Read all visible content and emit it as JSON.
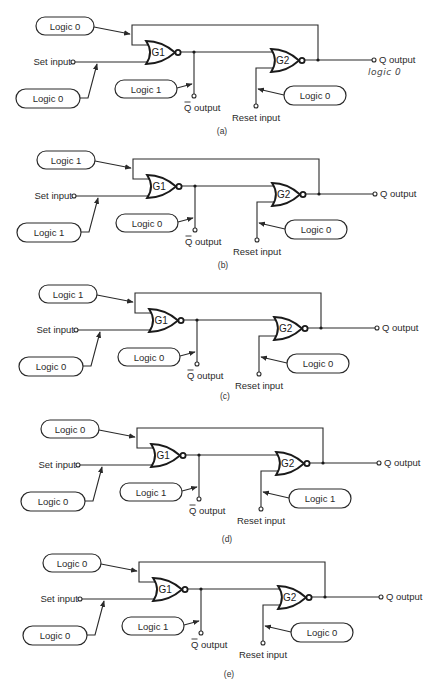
{
  "figure": {
    "common": {
      "set_input_label": "Set input",
      "reset_input_label": "Reset input",
      "q_output_label": "Q output",
      "qbar_output_label": "Q output",
      "gate1_label": "G1",
      "gate2_label": "G2"
    },
    "diagrams": [
      {
        "caption": "(a)",
        "dx": 0,
        "dy": 0,
        "cap_y": 134,
        "feedback_input": "Logic 0",
        "set_input_value": "Logic 0",
        "qbar_value": "Logic 1",
        "reset_input_value": "Logic 0",
        "annotation": "logic 0"
      },
      {
        "caption": "(b)",
        "dx": 1,
        "dy": 134,
        "cap_y": 268,
        "feedback_input": "Logic 1",
        "set_input_value": "Logic 1",
        "qbar_value": "Logic 0",
        "reset_input_value": "Logic 0",
        "annotation": ""
      },
      {
        "caption": "(c)",
        "dx": 3,
        "dy": 268,
        "cap_y": 399,
        "feedback_input": "Logic 1",
        "set_input_value": "Logic 0",
        "qbar_value": "Logic 0",
        "reset_input_value": "Logic 0",
        "annotation": ""
      },
      {
        "caption": "(d)",
        "dx": 5,
        "dy": 403,
        "cap_y": 542,
        "feedback_input": "Logic 0",
        "set_input_value": "Logic 0",
        "qbar_value": "Logic 1",
        "reset_input_value": "Logic 1",
        "annotation": ""
      },
      {
        "caption": "(e)",
        "dx": 7,
        "dy": 537,
        "cap_y": 677,
        "feedback_input": "Logic 0",
        "set_input_value": "Logic 0",
        "qbar_value": "Logic 1",
        "reset_input_value": "Logic 0",
        "annotation": ""
      }
    ]
  }
}
